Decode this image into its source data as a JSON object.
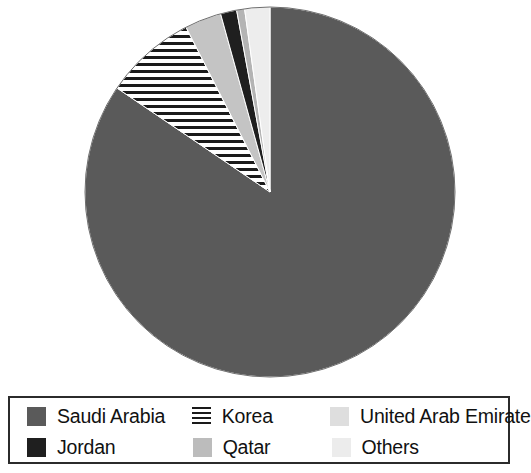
{
  "chart_data": {
    "type": "pie",
    "title": "",
    "subtitle": "",
    "xlabel": "",
    "ylabel": "",
    "grid": false,
    "legend_position": "bottom",
    "start_angle_deg": 0,
    "direction": "clockwise",
    "categories": [
      "Saudi Arabia",
      "Korea",
      "Qatar",
      "Jordan",
      "Others",
      "United Arab Emirate"
    ],
    "values": [
      84.5,
      8.0,
      3.2,
      1.4,
      0.7,
      2.2
    ],
    "unit": "percent",
    "slices": [
      {
        "label": "Saudi Arabia",
        "value": 84.5,
        "color": "#5a5a5a",
        "pattern": "solid",
        "start_deg": 0,
        "end_deg": 304.2
      },
      {
        "label": "Korea",
        "value": 8.0,
        "color": "#1a1a1a",
        "pattern": "horizontal-lines",
        "start_deg": 304.2,
        "end_deg": 333.0
      },
      {
        "label": "Qatar",
        "value": 3.2,
        "color": "#c4c4c4",
        "pattern": "solid",
        "start_deg": 333.0,
        "end_deg": 344.5
      },
      {
        "label": "Jordan",
        "value": 1.4,
        "color": "#1f1f1f",
        "pattern": "solid",
        "start_deg": 344.5,
        "end_deg": 349.6
      },
      {
        "label": "Others",
        "value": 0.7,
        "color": "#b4b4b4",
        "pattern": "solid",
        "start_deg": 349.6,
        "end_deg": 352.1
      },
      {
        "label": "United Arab Emirate",
        "value": 2.2,
        "color": "#ededed",
        "pattern": "solid",
        "start_deg": 352.1,
        "end_deg": 360.0
      }
    ]
  },
  "pie": {
    "center_x": 270,
    "center_y": 192,
    "radius": 185,
    "outline_color": "#6e6e6e"
  },
  "legend": {
    "border_color": "#2b2b2b",
    "background": "#ffffff",
    "rows": [
      [
        {
          "label": "Saudi Arabia",
          "swatch": "sw-solid",
          "icon": "legend-swatch-saudi-arabia"
        },
        {
          "label": "Korea",
          "swatch": "sw-hatch",
          "icon": "legend-swatch-korea"
        },
        {
          "label": "United Arab Emirate",
          "swatch": "sw-uae",
          "icon": "legend-swatch-united-arab-emirate"
        }
      ],
      [
        {
          "label": "Jordan",
          "swatch": "sw-black",
          "icon": "legend-swatch-jordan"
        },
        {
          "label": "Qatar",
          "swatch": "sw-qatar",
          "icon": "legend-swatch-qatar"
        },
        {
          "label": "Others",
          "swatch": "sw-others",
          "icon": "legend-swatch-others"
        }
      ]
    ]
  }
}
